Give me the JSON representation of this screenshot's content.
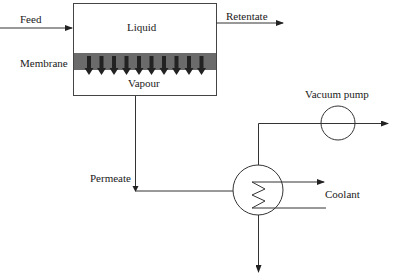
{
  "diagram": {
    "labels": {
      "feed": "Feed",
      "liquid": "Liquid",
      "retentate": "Retentate",
      "membrane": "Membrane",
      "vapour": "Vapour",
      "vacuum_pump": "Vacuum pump",
      "permeate": "Permeate",
      "coolant": "Coolant"
    },
    "components": [
      {
        "id": "membrane-module",
        "type": "box",
        "sections": [
          "Liquid",
          "Membrane",
          "Vapour"
        ]
      },
      {
        "id": "condenser",
        "type": "heat-exchanger"
      },
      {
        "id": "vacuum-pump",
        "type": "pump"
      }
    ],
    "flows": [
      {
        "from": "Feed",
        "to": "membrane-module"
      },
      {
        "from": "membrane-module",
        "to": "Retentate"
      },
      {
        "from": "membrane-module",
        "to": "condenser",
        "label": "Permeate"
      },
      {
        "from": "condenser",
        "to": "vacuum-pump"
      },
      {
        "from": "Coolant",
        "to": "condenser"
      },
      {
        "from": "condenser",
        "to": "outlet"
      }
    ],
    "colors": {
      "line": "#333333",
      "membrane": "#6b6b6b",
      "arrows": "#222222"
    },
    "membrane_arrow_count": 10
  }
}
